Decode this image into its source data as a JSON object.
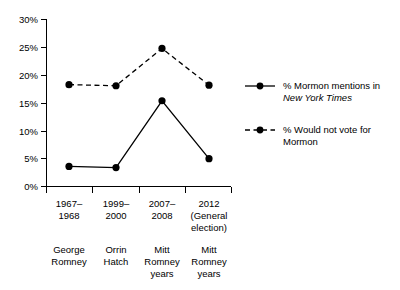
{
  "chart_data": {
    "type": "line",
    "title": "",
    "xlabel": "",
    "ylabel": "",
    "ylim": [
      0,
      30
    ],
    "ytick_labels": [
      "0%",
      "5%",
      "10%",
      "15%",
      "20%",
      "25%",
      "30%"
    ],
    "ytick_values": [
      0,
      5,
      10,
      15,
      20,
      25,
      30
    ],
    "grid": false,
    "legend_position": "right",
    "categories": [
      "1967–\n1968",
      "1999–\n2000",
      "2007–\n2008",
      "2012\n(General\nelection)"
    ],
    "category_lines": [
      [
        "1967–",
        "1968"
      ],
      [
        "1999–",
        "2000"
      ],
      [
        "2007–",
        "2008"
      ],
      [
        "2012",
        "(General",
        "election)"
      ]
    ],
    "category_sublabels": [
      [
        "George",
        "Romney"
      ],
      [
        "Orrin",
        "Hatch"
      ],
      [
        "Mitt",
        "Romney",
        "years"
      ],
      [
        "Mitt",
        "Romney",
        "years"
      ]
    ],
    "series": [
      {
        "name": "% Mormon mentions in New York Times",
        "style": "solid",
        "values": [
          3.6,
          3.4,
          15.4,
          5.0
        ]
      },
      {
        "name": "% Would not vote for Mormon",
        "style": "dashed",
        "values": [
          18.3,
          18.1,
          24.8,
          18.2
        ]
      }
    ]
  },
  "yaxis": {
    "ticks": [
      {
        "label": "30%",
        "value": 30
      },
      {
        "label": "25%",
        "value": 25
      },
      {
        "label": "20%",
        "value": 20
      },
      {
        "label": "15%",
        "value": 15
      },
      {
        "label": "10%",
        "value": 10
      },
      {
        "label": "5%",
        "value": 5
      },
      {
        "label": "0%",
        "value": 0
      }
    ]
  },
  "xaxis": {
    "period_labels": [
      {
        "line1": "1967–",
        "line2": "1968",
        "line3": ""
      },
      {
        "line1": "1999–",
        "line2": "2000",
        "line3": ""
      },
      {
        "line1": "2007–",
        "line2": "2008",
        "line3": ""
      },
      {
        "line1": "2012",
        "line2": "(General",
        "line3": "election)"
      }
    ],
    "person_labels": [
      {
        "line1": "George",
        "line2": "Romney",
        "line3": ""
      },
      {
        "line1": "Orrin",
        "line2": "Hatch",
        "line3": ""
      },
      {
        "line1": "Mitt",
        "line2": "Romney",
        "line3": "years"
      },
      {
        "line1": "Mitt",
        "line2": "Romney",
        "line3": "years"
      }
    ]
  },
  "legend": {
    "items": [
      {
        "style": "solid",
        "line1_a": "% Mormon mentions in",
        "line2_italic": "New York Times"
      },
      {
        "style": "dashed",
        "line1_a": "% Would not vote for",
        "line2_italic": "Mormon"
      }
    ]
  },
  "colors": {
    "line": "#000000",
    "marker": "#000000",
    "axis": "#000000",
    "background": "#ffffff"
  }
}
